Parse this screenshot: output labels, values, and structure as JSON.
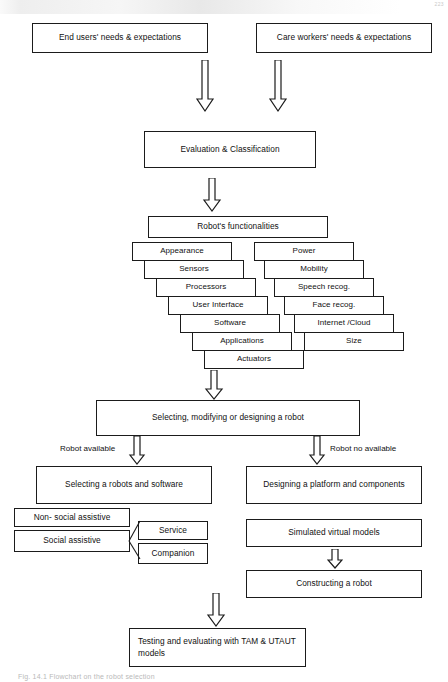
{
  "page": {
    "width": 448,
    "height": 682,
    "background": "#ffffff",
    "ink": "#1b1b1b",
    "page_number": "223"
  },
  "nodes": {
    "end_users": "End users' needs & expectations",
    "care_workers": "Care workers' needs & expectations",
    "evaluation": "Evaluation & Classification",
    "robot_functionalities": "Robot's functionalities",
    "selecting_designing": "Selecting,  modifying or designing a robot",
    "selecting_robots_software": "Selecting a robots and software",
    "designing_platform": "Designing a platform and components",
    "non_social_assistive": "Non- social assistive",
    "social_assistive": "Social assistive",
    "service": "Service",
    "companion": "Companion",
    "simulated_models": "Simulated virtual models",
    "constructing_robot": "Constructing a robot",
    "testing_evaluating": "Testing and evaluating with TAM & UTAUT models"
  },
  "cascade": {
    "left_column": [
      "Appearance",
      "Sensors",
      "Processors",
      "User Interface",
      "Software",
      "Applications",
      "Actuators"
    ],
    "right_column": [
      "Power",
      "Mobility",
      "Speech recog.",
      "Face recog.",
      "Internet /Cloud",
      "Size"
    ]
  },
  "edge_labels": {
    "robot_available": "Robot available",
    "robot_no_available": "Robot no available"
  },
  "arrows": [
    {
      "name": "arrow-end-users-to-evaluation"
    },
    {
      "name": "arrow-care-workers-to-evaluation"
    },
    {
      "name": "arrow-evaluation-to-functionalities"
    },
    {
      "name": "arrow-functionalities-to-selecting"
    },
    {
      "name": "arrow-selecting-to-left-branch"
    },
    {
      "name": "arrow-selecting-to-right-branch"
    },
    {
      "name": "arrow-simulated-to-constructing"
    },
    {
      "name": "arrow-to-testing"
    }
  ],
  "caption": "Fig. 14.1  Flowchart on the robot selection"
}
